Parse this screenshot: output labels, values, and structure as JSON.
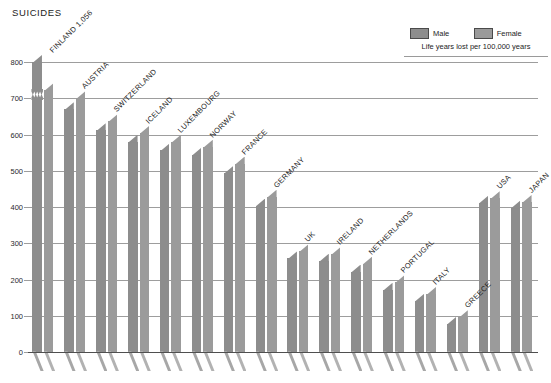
{
  "header": {
    "title": "SUICIDES"
  },
  "legend": {
    "entries": [
      {
        "label": "Male",
        "color": "#8d8d8d",
        "icon": "legend-swatch-icon"
      },
      {
        "label": "Female",
        "color": "#9b9b9b",
        "icon": "legend-swatch-icon"
      }
    ],
    "note": "Life years lost per 100,000 years"
  },
  "axis": {
    "y_ticks": [
      "800",
      "700",
      "600",
      "500",
      "400",
      "300",
      "200",
      "100",
      "0"
    ]
  },
  "chart_data": {
    "type": "bar",
    "title": "SUICIDES",
    "subtitle": "Life years lost per 100,000 years",
    "xlabel": "",
    "ylabel": "Life years lost per 100,000 years",
    "ylim": [
      0,
      800
    ],
    "ytick_step": 100,
    "grid": true,
    "legend_position": "top-right",
    "axis_break": {
      "series": "Male",
      "category": "FINLAND",
      "note": "Finland male bar exceeds the 800 axis maximum and is drawn with a zigzag break; actual value 1,056."
    },
    "categories": [
      "FINLAND",
      "AUSTRIA",
      "SWITZERLAND",
      "ICELAND",
      "LUXEMBOURG",
      "NORWAY",
      "FRANCE",
      "GERMANY",
      "UK",
      "IRELAND",
      "NETHERLANDS",
      "PORTUGAL",
      "ITALY",
      "GREECE",
      "USA",
      "JAPAN"
    ],
    "category_labels": [
      "FINLAND 1,056",
      "AUSTRIA",
      "SWITZERLAND",
      "ICELAND",
      "LUXEMBOURG",
      "NORWAY",
      "FRANCE",
      "GERMANY",
      "UK",
      "IRELAND",
      "NETHERLANDS",
      "PORTUGAL",
      "ITALY",
      "GREECE",
      "USA",
      "JAPAN"
    ],
    "series": [
      {
        "name": "Male",
        "color": "#8d8d8d",
        "values": [
          1056,
          670,
          612,
          580,
          556,
          544,
          494,
          404,
          258,
          252,
          222,
          172,
          142,
          78,
          412,
          398
        ]
      },
      {
        "name": "Female",
        "color": "#9b9b9b",
        "values": [
          722,
          700,
          636,
          604,
          580,
          566,
          520,
          428,
          278,
          270,
          244,
          192,
          160,
          96,
          424,
          414
        ]
      }
    ]
  }
}
